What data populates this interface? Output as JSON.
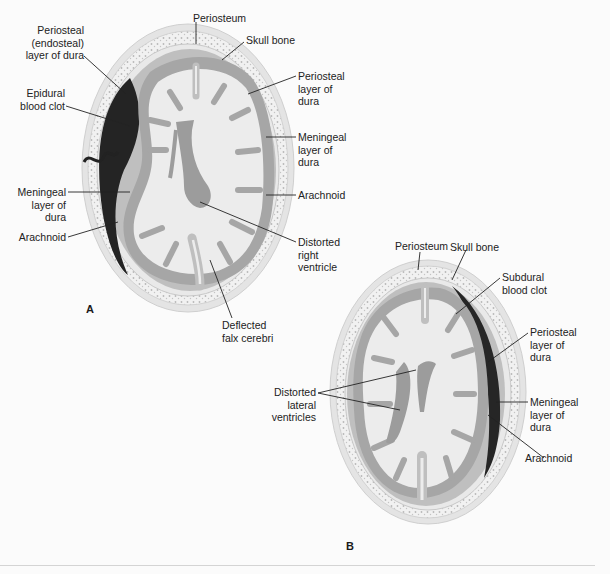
{
  "figure": {
    "panel_a": {
      "label": "A",
      "title": "Epidural hematoma",
      "annotations": [
        {
          "id": "periosteum",
          "text": "Periosteum"
        },
        {
          "id": "skull_bone",
          "text": "Skull bone"
        },
        {
          "id": "periosteal_endosteal",
          "text": "Periosteal\n(endosteal)\nlayer of dura"
        },
        {
          "id": "epidural_clot",
          "text": "Epidural\nblood clot"
        },
        {
          "id": "periosteal_layer_right",
          "text": "Periosteal\nlayer of\ndura"
        },
        {
          "id": "meningeal_layer_right",
          "text": "Meningeal\nlayer of\ndura"
        },
        {
          "id": "meningeal_layer_left",
          "text": "Meningeal\nlayer of\ndura"
        },
        {
          "id": "arachnoid_right",
          "text": "Arachnoid"
        },
        {
          "id": "arachnoid_left",
          "text": "Arachnoid"
        },
        {
          "id": "distorted_right_ventricle",
          "text": "Distorted\nright\nventricle"
        },
        {
          "id": "deflected_falx",
          "text": "Deflected\nfalx cerebri"
        }
      ]
    },
    "panel_b": {
      "label": "B",
      "title": "Subdural hematoma",
      "annotations": [
        {
          "id": "periosteum",
          "text": "Periosteum"
        },
        {
          "id": "skull_bone",
          "text": "Skull bone"
        },
        {
          "id": "subdural_clot",
          "text": "Subdural\nblood clot"
        },
        {
          "id": "periosteal_layer",
          "text": "Periosteal\nlayer of\ndura"
        },
        {
          "id": "meningeal_layer",
          "text": "Meningeal\nlayer of\ndura"
        },
        {
          "id": "arachnoid",
          "text": "Arachnoid"
        },
        {
          "id": "distorted_lateral_ventricles",
          "text": "Distorted\nlateral\nventricles"
        }
      ]
    },
    "colors": {
      "background": "#fbfbfb",
      "scalp": "#e6e6e6",
      "bone": "#f1f1f1",
      "dura": "#bdbdbd",
      "gray_matter": "#a9a9a9",
      "white_matter": "#ececec",
      "ventricle": "#9a9a9a",
      "clot": "#2a2a2a",
      "leader_line": "#222222"
    }
  }
}
